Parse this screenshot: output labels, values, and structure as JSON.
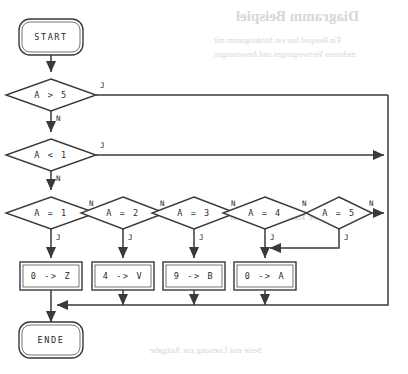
{
  "diagram": {
    "kind": "flowchart",
    "title_visible": false,
    "colors": {
      "stroke": "#3a3a3a",
      "text": "#2b2b2b",
      "background": "#ffffff",
      "bleed_through": "#d9d6d2"
    },
    "terminals": [
      {
        "id": "start",
        "label": "START",
        "cx": 51,
        "cy": 37
      },
      {
        "id": "ende",
        "label": "ENDE",
        "cx": 51,
        "cy": 340
      }
    ],
    "decisions": [
      {
        "id": "d-gt5",
        "label": "A > 5",
        "cx": 51,
        "cy": 95,
        "rx": 45,
        "ry": 16,
        "yes": "J",
        "no": "N"
      },
      {
        "id": "d-lt1",
        "label": "A < 1",
        "cx": 51,
        "cy": 155,
        "rx": 45,
        "ry": 16,
        "yes": "J",
        "no": "N"
      },
      {
        "id": "d-eq1",
        "label": "A = 1",
        "cx": 51,
        "cy": 213,
        "rx": 45,
        "ry": 16,
        "yes": "J",
        "no": "N"
      },
      {
        "id": "d-eq2",
        "label": "A = 2",
        "cx": 123,
        "cy": 213,
        "rx": 42,
        "ry": 16,
        "yes": "J",
        "no": "N"
      },
      {
        "id": "d-eq3",
        "label": "A = 3",
        "cx": 194,
        "cy": 213,
        "rx": 42,
        "ry": 16,
        "yes": "J",
        "no": "N"
      },
      {
        "id": "d-eq4",
        "label": "A = 4",
        "cx": 265,
        "cy": 213,
        "rx": 42,
        "ry": 16,
        "yes": "J",
        "no": "N"
      },
      {
        "id": "d-eq5",
        "label": "A = 5",
        "cx": 339,
        "cy": 213,
        "rx": 33,
        "ry": 16,
        "yes": "J",
        "no": "N"
      }
    ],
    "processes": [
      {
        "id": "p-z",
        "label": "0 -> Z",
        "cx": 51,
        "cy": 276,
        "w": 62,
        "h": 28
      },
      {
        "id": "p-v",
        "label": "4 -> V",
        "cx": 123,
        "cy": 276,
        "w": 62,
        "h": 28
      },
      {
        "id": "p-b",
        "label": "9 -> B",
        "cx": 194,
        "cy": 276,
        "w": 62,
        "h": 28
      },
      {
        "id": "p-a",
        "label": "0 -> A",
        "cx": 265,
        "cy": 276,
        "w": 62,
        "h": 28
      }
    ],
    "edge_labels": [
      {
        "id": "lbl-gt5-j",
        "text": "J",
        "x": 100,
        "y": 88
      },
      {
        "id": "lbl-gt5-n",
        "text": "N",
        "x": 56,
        "y": 121
      },
      {
        "id": "lbl-lt1-j",
        "text": "J",
        "x": 100,
        "y": 148
      },
      {
        "id": "lbl-lt1-n",
        "text": "N",
        "x": 56,
        "y": 181
      },
      {
        "id": "lbl-eq1-n",
        "text": "N",
        "x": 89,
        "y": 206
      },
      {
        "id": "lbl-eq1-j",
        "text": "J",
        "x": 56,
        "y": 240
      },
      {
        "id": "lbl-eq2-n",
        "text": "N",
        "x": 160,
        "y": 206
      },
      {
        "id": "lbl-eq2-j",
        "text": "J",
        "x": 128,
        "y": 240
      },
      {
        "id": "lbl-eq3-n",
        "text": "N",
        "x": 231,
        "y": 206
      },
      {
        "id": "lbl-eq3-j",
        "text": "J",
        "x": 199,
        "y": 240
      },
      {
        "id": "lbl-eq4-n",
        "text": "N",
        "x": 302,
        "y": 206
      },
      {
        "id": "lbl-eq4-j",
        "text": "J",
        "x": 270,
        "y": 240
      },
      {
        "id": "lbl-eq5-n",
        "text": "N",
        "x": 369,
        "y": 206
      },
      {
        "id": "lbl-eq5-j",
        "text": "J",
        "x": 344,
        "y": 240
      }
    ],
    "rails": {
      "right_rail_x": 388,
      "collector_y": 305,
      "merge_y": 248
    }
  },
  "bleed_through": {
    "title": "Diagramm Beispiel",
    "line1": "Ein Beispiel fuer ein Struktogramm mit",
    "line2": "mehreren Verzweigungen und Anweisungen",
    "line3": "Aufgabe zum Ablaufplan",
    "line4": "Seite mit Loesung zur Aufgabe"
  }
}
